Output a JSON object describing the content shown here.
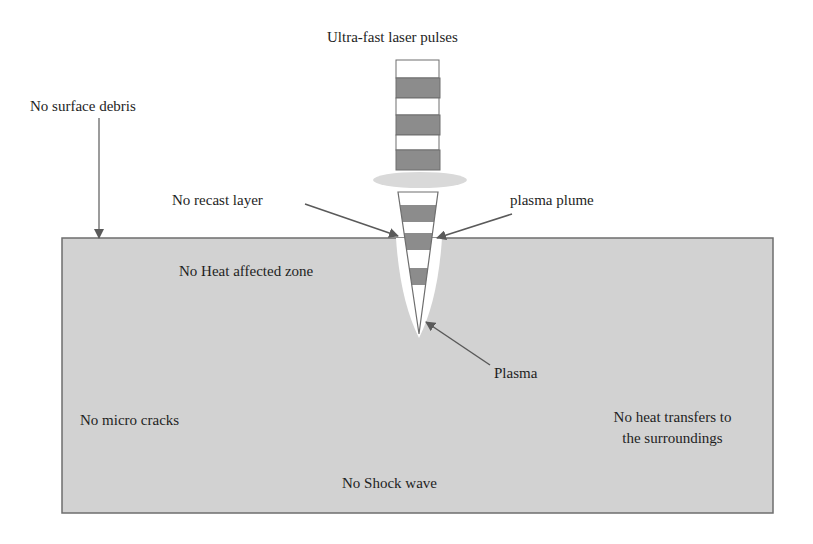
{
  "diagram": {
    "title": "Ultra-fast laser pulses",
    "colors": {
      "background": "#ffffff",
      "substrate_fill": "#d2d2d2",
      "substrate_border": "#6e6e6e",
      "pulse_dark": "#8c8c8c",
      "pulse_light": "#ffffff",
      "plume_fill": "#d9d9d9",
      "arrow": "#5a5a5a",
      "text": "#1e1e1e"
    },
    "labels": {
      "laser_pulses": "Ultra-fast laser pulses",
      "no_surface_debris": "No surface debris",
      "no_recast_layer": "No recast layer",
      "plasma_plume": "plasma plume",
      "no_heat_affected_zone": "No Heat affected zone",
      "plasma": "Plasma",
      "no_micro_cracks": "No micro cracks",
      "no_heat_transfers_line1": "No heat transfers to",
      "no_heat_transfers_line2": "the surroundings",
      "no_shock_wave": "No Shock wave"
    },
    "pulse_train": {
      "bands": [
        "light",
        "dark",
        "light",
        "dark",
        "light",
        "dark"
      ]
    },
    "ablation_cone": {
      "bands": [
        "light",
        "dark",
        "light",
        "dark",
        "light",
        "dark",
        "light"
      ]
    }
  }
}
